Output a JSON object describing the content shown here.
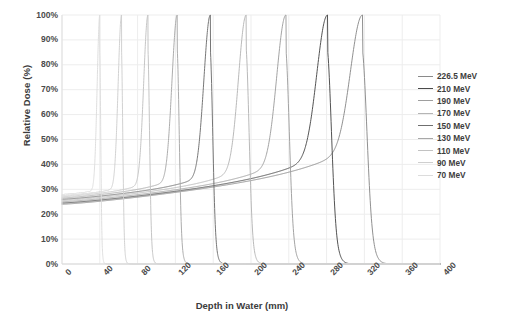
{
  "chart_data": {
    "type": "line",
    "title": "",
    "xlabel": "Depth in Water (mm)",
    "ylabel": "Relative Dose (%)",
    "xlim": [
      0,
      400
    ],
    "ylim": [
      0,
      100
    ],
    "xticks": [
      "0",
      "40",
      "80",
      "120",
      "160",
      "200",
      "240",
      "280",
      "320",
      "360",
      "400"
    ],
    "yticks": [
      "0%",
      "10%",
      "20%",
      "30%",
      "40%",
      "50%",
      "60%",
      "70%",
      "80%",
      "90%",
      "100%"
    ],
    "grid": true,
    "legend_position": "right",
    "units": {
      "x": "mm",
      "y": "%"
    },
    "series": [
      {
        "name": "226.5 MeV",
        "color": "#8a8a8a",
        "peak_depth": 318,
        "entrance_dose": 24.0,
        "plateau_dose": 40.0,
        "peak_dose": 100,
        "distal_end": 327
      },
      {
        "name": "210 MeV",
        "color": "#4a4a4a",
        "peak_depth": 281,
        "entrance_dose": 24.5,
        "plateau_dose": 38.0,
        "peak_dose": 100,
        "distal_end": 289
      },
      {
        "name": "190 MeV",
        "color": "#9e9e9e",
        "peak_depth": 237,
        "entrance_dose": 25.0,
        "plateau_dose": 36.0,
        "peak_dose": 100,
        "distal_end": 244
      },
      {
        "name": "170 MeV",
        "color": "#b5b5b5",
        "peak_depth": 195,
        "entrance_dose": 25.5,
        "plateau_dose": 34.5,
        "peak_dose": 100,
        "distal_end": 201
      },
      {
        "name": "150 MeV",
        "color": "#6f6f6f",
        "peak_depth": 157,
        "entrance_dose": 26.0,
        "plateau_dose": 33.0,
        "peak_dose": 100,
        "distal_end": 162
      },
      {
        "name": "130 MeV",
        "color": "#a8a8a8",
        "peak_depth": 122,
        "entrance_dose": 26.5,
        "plateau_dose": 32.0,
        "peak_dose": 100,
        "distal_end": 126
      },
      {
        "name": "110 MeV",
        "color": "#c2c2c2",
        "peak_depth": 91,
        "entrance_dose": 27.0,
        "plateau_dose": 31.0,
        "peak_dose": 100,
        "distal_end": 94
      },
      {
        "name": "90 MeV",
        "color": "#cfcfcf",
        "peak_depth": 63,
        "entrance_dose": 27.5,
        "plateau_dose": 30.0,
        "peak_dose": 100,
        "distal_end": 65
      },
      {
        "name": "70 MeV",
        "color": "#dcdcdc",
        "peak_depth": 40,
        "entrance_dose": 28.0,
        "plateau_dose": 29.5,
        "peak_dose": 100,
        "distal_end": 42
      }
    ]
  },
  "axes": {
    "y_title": "Relative Dose (%)",
    "x_title": "Depth in Water (mm)"
  },
  "legend": {
    "items": [
      {
        "label": "226.5 MeV"
      },
      {
        "label": "210 MeV"
      },
      {
        "label": "190 MeV"
      },
      {
        "label": "170 MeV"
      },
      {
        "label": "150 MeV"
      },
      {
        "label": "130 MeV"
      },
      {
        "label": "110 MeV"
      },
      {
        "label": "90 MeV"
      },
      {
        "label": "70 MeV"
      }
    ]
  },
  "colors": {
    "grid": "#ededed",
    "axis_text": "#4a4a4a",
    "title_text": "#3b3b3b",
    "background": "#ffffff"
  }
}
